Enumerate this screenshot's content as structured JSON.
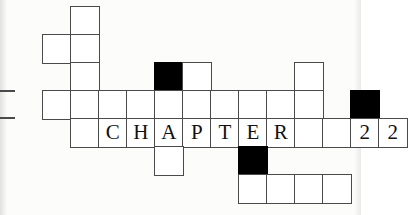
{
  "artwork": {
    "title": "CHAPTER 22",
    "kind": "crossword-grid-chapter-heading",
    "grid": {
      "cell_size": 28,
      "origin_x": 14,
      "origin_y": 6,
      "line_color": "#4a4a4a",
      "fill_color": "#000000",
      "paper_color": "#ffffff"
    }
  },
  "cells": [
    {
      "name": "cell-r0c2",
      "col": 2,
      "row": 0,
      "filled": false,
      "glyph": ""
    },
    {
      "name": "cell-r1c1",
      "col": 1,
      "row": 1,
      "filled": false,
      "glyph": ""
    },
    {
      "name": "cell-r1c2",
      "col": 2,
      "row": 1,
      "filled": false,
      "glyph": ""
    },
    {
      "name": "cell-r2c2",
      "col": 2,
      "row": 2,
      "filled": false,
      "glyph": ""
    },
    {
      "name": "cell-r2c5",
      "col": 5,
      "row": 2,
      "filled": true,
      "glyph": ""
    },
    {
      "name": "cell-r2c6",
      "col": 6,
      "row": 2,
      "filled": false,
      "glyph": ""
    },
    {
      "name": "cell-r2c10",
      "col": 10,
      "row": 2,
      "filled": false,
      "glyph": ""
    },
    {
      "name": "cell-r3c1",
      "col": 1,
      "row": 3,
      "filled": false,
      "glyph": ""
    },
    {
      "name": "cell-r3c2",
      "col": 2,
      "row": 3,
      "filled": false,
      "glyph": ""
    },
    {
      "name": "cell-r3c3",
      "col": 3,
      "row": 3,
      "filled": false,
      "glyph": ""
    },
    {
      "name": "cell-r3c4",
      "col": 4,
      "row": 3,
      "filled": false,
      "glyph": ""
    },
    {
      "name": "cell-r3c5",
      "col": 5,
      "row": 3,
      "filled": false,
      "glyph": ""
    },
    {
      "name": "cell-r3c6",
      "col": 6,
      "row": 3,
      "filled": false,
      "glyph": ""
    },
    {
      "name": "cell-r3c7",
      "col": 7,
      "row": 3,
      "filled": false,
      "glyph": ""
    },
    {
      "name": "cell-r3c8",
      "col": 8,
      "row": 3,
      "filled": false,
      "glyph": ""
    },
    {
      "name": "cell-r3c9",
      "col": 9,
      "row": 3,
      "filled": false,
      "glyph": ""
    },
    {
      "name": "cell-r3c10",
      "col": 10,
      "row": 3,
      "filled": false,
      "glyph": ""
    },
    {
      "name": "cell-r3c12",
      "col": 12,
      "row": 3,
      "filled": true,
      "glyph": ""
    },
    {
      "name": "cell-r4c2",
      "col": 2,
      "row": 4,
      "filled": false,
      "glyph": ""
    },
    {
      "name": "cell-r4c3",
      "col": 3,
      "row": 4,
      "filled": false,
      "glyph": "C"
    },
    {
      "name": "cell-r4c4",
      "col": 4,
      "row": 4,
      "filled": false,
      "glyph": "H"
    },
    {
      "name": "cell-r4c5",
      "col": 5,
      "row": 4,
      "filled": false,
      "glyph": "A"
    },
    {
      "name": "cell-r4c6",
      "col": 6,
      "row": 4,
      "filled": false,
      "glyph": "P"
    },
    {
      "name": "cell-r4c7",
      "col": 7,
      "row": 4,
      "filled": false,
      "glyph": "T"
    },
    {
      "name": "cell-r4c8",
      "col": 8,
      "row": 4,
      "filled": false,
      "glyph": "E"
    },
    {
      "name": "cell-r4c9",
      "col": 9,
      "row": 4,
      "filled": false,
      "glyph": "R"
    },
    {
      "name": "cell-r4c10",
      "col": 10,
      "row": 4,
      "filled": false,
      "glyph": ""
    },
    {
      "name": "cell-r4c11",
      "col": 11,
      "row": 4,
      "filled": false,
      "glyph": ""
    },
    {
      "name": "cell-r4c12",
      "col": 12,
      "row": 4,
      "filled": false,
      "glyph": "2"
    },
    {
      "name": "cell-r4c13",
      "col": 13,
      "row": 4,
      "filled": false,
      "glyph": "2"
    },
    {
      "name": "cell-r5c5",
      "col": 5,
      "row": 5,
      "filled": false,
      "glyph": ""
    },
    {
      "name": "cell-r5c8",
      "col": 8,
      "row": 5,
      "filled": true,
      "glyph": ""
    },
    {
      "name": "cell-r6c8",
      "col": 8,
      "row": 6,
      "filled": false,
      "glyph": ""
    },
    {
      "name": "cell-r6c9",
      "col": 9,
      "row": 6,
      "filled": false,
      "glyph": ""
    },
    {
      "name": "cell-r6c10",
      "col": 10,
      "row": 6,
      "filled": false,
      "glyph": ""
    },
    {
      "name": "cell-r6c11",
      "col": 11,
      "row": 6,
      "filled": false,
      "glyph": ""
    }
  ],
  "stubs": [
    {
      "name": "grid-stub-left-top",
      "x": 0,
      "y": 90,
      "width": 15
    },
    {
      "name": "grid-stub-left-bottom",
      "x": 0,
      "y": 117,
      "width": 15
    }
  ]
}
